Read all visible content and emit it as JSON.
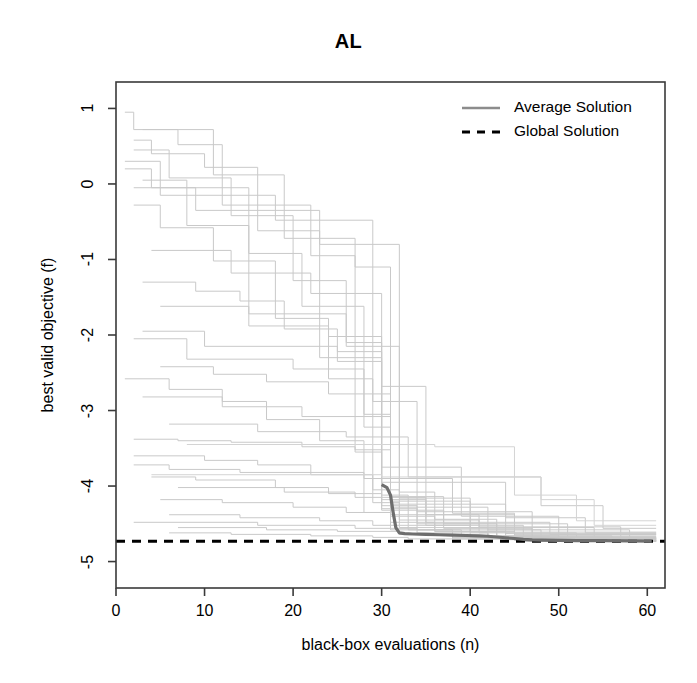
{
  "chart_data": {
    "type": "line",
    "title": "AL",
    "xlabel": "black-box evaluations (n)",
    "ylabel": "best valid objective (f)",
    "xlim": [
      0,
      62
    ],
    "ylim": [
      -5.35,
      1.35
    ],
    "xticks": [
      0,
      10,
      20,
      30,
      40,
      50,
      60
    ],
    "xtick_labels": [
      "0",
      "10",
      "20",
      "30",
      "40",
      "50",
      "60"
    ],
    "yticks": [
      1,
      0,
      -1,
      -2,
      -3,
      -4,
      -5
    ],
    "ytick_labels": [
      "1",
      "0",
      "-1",
      "-2",
      "-3",
      "-4",
      "-5"
    ],
    "grid": false,
    "legend_position": "top-right",
    "legend": [
      {
        "label": "Average Solution",
        "style": "solid",
        "color": "#8c8c8c",
        "width": 2.6
      },
      {
        "label": "Global Solution",
        "style": "dashed",
        "color": "#000000",
        "width": 3.0
      }
    ],
    "global_solution_value": -4.73,
    "series": [
      {
        "name": "Average Solution",
        "kind": "average",
        "color": "#6e6e6e",
        "width": 3.2,
        "x": [
          30,
          30.6,
          31.0,
          31.3,
          31.6,
          32.0,
          32.6,
          33.5,
          35,
          36.5,
          38,
          39.5,
          41,
          42,
          43,
          44,
          45,
          46,
          47,
          48,
          50,
          52,
          55,
          58,
          60.5
        ],
        "y": [
          -3.98,
          -4.02,
          -4.12,
          -4.35,
          -4.55,
          -4.62,
          -4.63,
          -4.635,
          -4.64,
          -4.645,
          -4.65,
          -4.655,
          -4.66,
          -4.665,
          -4.675,
          -4.685,
          -4.695,
          -4.705,
          -4.712,
          -4.716,
          -4.72,
          -4.722,
          -4.724,
          -4.726,
          -4.728
        ]
      },
      {
        "name": "run-01",
        "kind": "trace",
        "color": "#c9c9c9",
        "width": 1,
        "x": [
          1,
          2,
          2,
          7,
          7,
          12,
          12,
          22,
          22,
          27,
          27,
          31,
          31,
          45,
          45,
          61
        ],
        "y": [
          0.95,
          0.95,
          0.72,
          0.72,
          0.52,
          0.52,
          -0.28,
          -0.28,
          -0.95,
          -0.95,
          -3.52,
          -3.52,
          -4.38,
          -4.38,
          -4.66,
          -4.66
        ]
      },
      {
        "name": "run-02",
        "kind": "trace",
        "color": "#c9c9c9",
        "width": 1,
        "x": [
          2,
          4,
          4,
          10,
          10,
          16,
          16,
          23,
          23,
          30,
          30,
          34,
          34,
          48,
          48,
          61
        ],
        "y": [
          0.58,
          0.58,
          0.4,
          0.4,
          0.22,
          0.22,
          -0.62,
          -0.62,
          -2.3,
          -2.3,
          -4.3,
          -4.3,
          -4.58,
          -4.58,
          -4.7,
          -4.7
        ]
      },
      {
        "name": "run-03",
        "kind": "trace",
        "color": "#c9c9c9",
        "width": 1,
        "x": [
          2,
          6,
          6,
          13,
          13,
          20,
          20,
          26,
          26,
          30,
          30,
          33,
          33,
          40,
          40,
          61
        ],
        "y": [
          0.45,
          0.45,
          0.08,
          0.08,
          -0.42,
          -0.42,
          -1.28,
          -1.28,
          -2.1,
          -2.1,
          -4.12,
          -4.12,
          -4.52,
          -4.52,
          -4.68,
          -4.68
        ]
      },
      {
        "name": "run-04",
        "kind": "trace",
        "color": "#c9c9c9",
        "width": 1,
        "x": [
          3,
          8,
          8,
          15,
          15,
          21,
          21,
          28,
          28,
          31,
          31,
          36,
          36,
          44,
          44,
          61
        ],
        "y": [
          0.05,
          0.05,
          -0.55,
          -0.55,
          -0.92,
          -0.92,
          -1.62,
          -1.62,
          -3.05,
          -3.05,
          -4.4,
          -4.4,
          -4.6,
          -4.6,
          -4.71,
          -4.71
        ]
      },
      {
        "name": "run-05",
        "kind": "trace",
        "color": "#c9c9c9",
        "width": 1,
        "x": [
          2,
          5,
          5,
          11,
          11,
          18,
          18,
          24,
          24,
          29,
          29,
          32,
          32,
          42,
          42,
          61
        ],
        "y": [
          -0.28,
          -0.28,
          -0.58,
          -0.58,
          -1.02,
          -1.02,
          -1.78,
          -1.78,
          -2.58,
          -2.58,
          -4.22,
          -4.22,
          -4.55,
          -4.55,
          -4.69,
          -4.69
        ]
      },
      {
        "name": "run-06",
        "kind": "trace",
        "color": "#c9c9c9",
        "width": 1,
        "x": [
          3,
          9,
          9,
          14,
          14,
          19,
          19,
          25,
          25,
          30,
          30,
          35,
          35,
          46,
          46,
          61
        ],
        "y": [
          -1.3,
          -1.3,
          -1.42,
          -1.42,
          -1.55,
          -1.55,
          -1.92,
          -1.92,
          -2.22,
          -2.22,
          -4.18,
          -4.18,
          -4.52,
          -4.52,
          -4.7,
          -4.7
        ]
      },
      {
        "name": "run-07",
        "kind": "trace",
        "color": "#c9c9c9",
        "width": 1,
        "x": [
          1,
          6,
          6,
          12,
          12,
          17,
          17,
          23,
          23,
          28,
          28,
          31,
          31,
          38,
          38,
          61
        ],
        "y": [
          -2.58,
          -2.58,
          -2.72,
          -2.72,
          -2.88,
          -2.88,
          -3.12,
          -3.12,
          -3.4,
          -3.4,
          -4.35,
          -4.35,
          -4.58,
          -4.58,
          -4.7,
          -4.7
        ]
      },
      {
        "name": "run-08",
        "kind": "trace",
        "color": "#c9c9c9",
        "width": 1,
        "x": [
          2,
          7,
          7,
          13,
          13,
          21,
          21,
          27,
          27,
          30,
          30,
          37,
          37,
          47,
          47,
          61
        ],
        "y": [
          -3.38,
          -3.38,
          -3.4,
          -3.4,
          -3.42,
          -3.42,
          -3.48,
          -3.48,
          -3.55,
          -3.55,
          -4.32,
          -4.32,
          -4.56,
          -4.56,
          -4.72,
          -4.72
        ]
      },
      {
        "name": "run-09",
        "kind": "trace",
        "color": "#c9c9c9",
        "width": 1,
        "x": [
          2,
          10,
          10,
          16,
          16,
          22,
          22,
          29,
          29,
          32,
          32,
          41,
          41,
          52,
          52,
          61
        ],
        "y": [
          -3.6,
          -3.6,
          -3.66,
          -3.66,
          -3.72,
          -3.72,
          -3.85,
          -3.85,
          -4.05,
          -4.05,
          -4.45,
          -4.45,
          -4.62,
          -4.62,
          -4.72,
          -4.72
        ]
      },
      {
        "name": "run-10",
        "kind": "trace",
        "color": "#c9c9c9",
        "width": 1,
        "x": [
          4,
          9,
          9,
          18,
          18,
          24,
          24,
          30,
          30,
          34,
          34,
          43,
          43,
          56,
          56,
          61
        ],
        "y": [
          -3.88,
          -3.88,
          -3.92,
          -3.92,
          -4.02,
          -4.02,
          -4.1,
          -4.1,
          -4.26,
          -4.26,
          -4.5,
          -4.5,
          -4.66,
          -4.66,
          -4.73,
          -4.73
        ]
      },
      {
        "name": "run-11",
        "kind": "trace",
        "color": "#c9c9c9",
        "width": 1,
        "x": [
          5,
          12,
          12,
          20,
          20,
          26,
          26,
          31,
          31,
          36,
          36,
          45,
          45,
          61
        ],
        "y": [
          -4.18,
          -4.18,
          -4.22,
          -4.22,
          -4.28,
          -4.28,
          -4.35,
          -4.35,
          -4.48,
          -4.48,
          -4.6,
          -4.6,
          -4.72,
          -4.72
        ]
      },
      {
        "name": "run-12",
        "kind": "trace",
        "color": "#c9c9c9",
        "width": 1,
        "x": [
          6,
          14,
          14,
          23,
          23,
          29,
          29,
          33,
          33,
          39,
          39,
          50,
          50,
          61
        ],
        "y": [
          -4.38,
          -4.38,
          -4.42,
          -4.42,
          -4.46,
          -4.46,
          -4.52,
          -4.52,
          -4.58,
          -4.58,
          -4.66,
          -4.66,
          -4.73,
          -4.73
        ]
      },
      {
        "name": "run-13",
        "kind": "trace",
        "color": "#c9c9c9",
        "width": 1,
        "x": [
          7,
          17,
          17,
          25,
          25,
          32,
          32,
          38,
          38,
          46,
          46,
          61
        ],
        "y": [
          -4.55,
          -4.55,
          -4.58,
          -4.58,
          -4.6,
          -4.6,
          -4.64,
          -4.64,
          -4.68,
          -4.68,
          -4.73,
          -4.73
        ]
      },
      {
        "name": "run-14",
        "kind": "trace",
        "color": "#c9c9c9",
        "width": 1,
        "x": [
          3,
          11,
          11,
          19,
          19,
          27,
          27,
          31,
          31,
          40,
          40,
          54,
          54,
          61
        ],
        "y": [
          0.72,
          0.72,
          0.12,
          0.12,
          -0.72,
          -0.72,
          -1.1,
          -1.1,
          -4.2,
          -4.2,
          -4.55,
          -4.55,
          -4.7,
          -4.7
        ]
      },
      {
        "name": "run-15",
        "kind": "trace",
        "color": "#c9c9c9",
        "width": 1,
        "x": [
          4,
          13,
          13,
          22,
          22,
          30,
          30,
          35,
          35,
          49,
          49,
          61
        ],
        "y": [
          -0.88,
          -0.88,
          -1.18,
          -1.18,
          -1.45,
          -1.45,
          -2.68,
          -2.68,
          -4.48,
          -4.48,
          -4.64,
          -4.64
        ]
      },
      {
        "name": "run-16",
        "kind": "trace",
        "color": "#c9c9c9",
        "width": 1,
        "x": [
          2,
          8,
          8,
          20,
          20,
          28,
          28,
          31,
          31,
          42,
          42,
          58,
          58,
          61
        ],
        "y": [
          -2.05,
          -2.05,
          -2.32,
          -2.32,
          -2.45,
          -2.45,
          -3.22,
          -3.22,
          -4.28,
          -4.28,
          -4.58,
          -4.58,
          -4.72,
          -4.72
        ]
      },
      {
        "name": "run-17",
        "kind": "trace",
        "color": "#c9c9c9",
        "width": 1,
        "x": [
          5,
          15,
          15,
          24,
          24,
          30,
          30,
          44,
          44,
          53,
          53,
          61
        ],
        "y": [
          -1.62,
          -1.62,
          -1.88,
          -1.88,
          -2.02,
          -2.02,
          -3.95,
          -3.95,
          -4.42,
          -4.42,
          -4.62,
          -4.62
        ]
      },
      {
        "name": "run-18",
        "kind": "trace",
        "color": "#c9c9c9",
        "width": 1,
        "x": [
          6,
          16,
          16,
          26,
          26,
          33,
          33,
          48,
          48,
          55,
          55,
          61
        ],
        "y": [
          -3.18,
          -3.18,
          -3.28,
          -3.28,
          -3.35,
          -3.35,
          -3.88,
          -3.88,
          -4.26,
          -4.26,
          -4.56,
          -4.56
        ]
      },
      {
        "name": "run-19",
        "kind": "trace",
        "color": "#c9c9c9",
        "width": 1,
        "x": [
          1,
          5,
          5,
          18,
          18,
          29,
          29,
          34,
          34,
          47,
          47,
          61
        ],
        "y": [
          0.3,
          0.3,
          -0.15,
          -0.15,
          -0.48,
          -0.48,
          -2.88,
          -2.88,
          -4.34,
          -4.34,
          -4.68,
          -4.68
        ]
      },
      {
        "name": "run-20",
        "kind": "trace",
        "color": "#c9c9c9",
        "width": 1,
        "x": [
          3,
          12,
          12,
          21,
          21,
          31,
          31,
          37,
          37,
          51,
          51,
          61
        ],
        "y": [
          -2.82,
          -2.82,
          -2.95,
          -2.95,
          -3.08,
          -3.08,
          -4.14,
          -4.14,
          -4.5,
          -4.5,
          -4.7,
          -4.7
        ]
      },
      {
        "name": "run-21",
        "kind": "trace",
        "color": "#c9c9c9",
        "width": 1,
        "x": [
          2,
          9,
          9,
          23,
          23,
          32,
          32,
          36,
          36,
          43,
          43,
          61
        ],
        "y": [
          -0.05,
          -0.05,
          -0.35,
          -0.35,
          -0.8,
          -0.8,
          -4.08,
          -4.08,
          -4.44,
          -4.44,
          -4.67,
          -4.67
        ]
      },
      {
        "name": "run-22",
        "kind": "trace",
        "color": "#c9c9c9",
        "width": 1,
        "x": [
          7,
          19,
          19,
          27,
          27,
          35,
          35,
          41,
          41,
          57,
          57,
          61
        ],
        "y": [
          -4.02,
          -4.02,
          -4.08,
          -4.08,
          -4.15,
          -4.15,
          -4.38,
          -4.38,
          -4.54,
          -4.54,
          -4.71,
          -4.71
        ]
      },
      {
        "name": "run-23",
        "kind": "trace",
        "color": "#c9c9c9",
        "width": 1,
        "x": [
          3,
          10,
          10,
          25,
          25,
          30,
          30,
          39,
          39,
          50,
          50,
          61
        ],
        "y": [
          -1.95,
          -1.95,
          -2.15,
          -2.15,
          -2.35,
          -2.35,
          -3.75,
          -3.75,
          -4.4,
          -4.4,
          -4.69,
          -4.69
        ]
      },
      {
        "name": "run-24",
        "kind": "trace",
        "color": "#c9c9c9",
        "width": 1,
        "x": [
          2,
          6,
          6,
          14,
          14,
          28,
          28,
          38,
          38,
          45,
          45,
          61
        ],
        "y": [
          -3.72,
          -3.72,
          -3.78,
          -3.78,
          -3.82,
          -3.82,
          -3.9,
          -3.9,
          -4.36,
          -4.36,
          -4.64,
          -4.64
        ]
      },
      {
        "name": "run-25-late",
        "kind": "trace",
        "color": "#d4d4d4",
        "width": 1,
        "x": [
          4,
          30,
          30,
          48,
          48,
          54,
          54,
          61
        ],
        "y": [
          -3.85,
          -3.85,
          -3.88,
          -3.88,
          -4.18,
          -4.18,
          -4.52,
          -4.52
        ]
      },
      {
        "name": "run-26-late",
        "kind": "trace",
        "color": "#d4d4d4",
        "width": 1,
        "x": [
          8,
          36,
          36,
          45,
          45,
          52,
          52,
          61
        ],
        "y": [
          -3.45,
          -3.45,
          -3.48,
          -3.48,
          -4.12,
          -4.12,
          -4.46,
          -4.46
        ]
      },
      {
        "name": "run-27",
        "kind": "trace",
        "color": "#c9c9c9",
        "width": 1,
        "x": [
          5,
          11,
          11,
          17,
          17,
          24,
          24,
          31,
          31,
          44,
          44,
          61
        ],
        "y": [
          -2.42,
          -2.42,
          -2.52,
          -2.52,
          -2.62,
          -2.62,
          -2.78,
          -2.78,
          -4.24,
          -4.24,
          -4.63,
          -4.63
        ]
      },
      {
        "name": "run-28",
        "kind": "trace",
        "color": "#c9c9c9",
        "width": 1,
        "x": [
          1,
          4,
          4,
          15,
          15,
          26,
          26,
          32,
          32,
          40,
          40,
          61
        ],
        "y": [
          0.2,
          0.2,
          -0.05,
          -0.05,
          -1.72,
          -1.72,
          -2.15,
          -2.15,
          -4.16,
          -4.16,
          -4.61,
          -4.61
        ]
      },
      {
        "name": "run-29",
        "kind": "trace",
        "color": "#c9c9c9",
        "width": 1,
        "x": [
          6,
          13,
          13,
          22,
          22,
          29,
          29,
          33,
          33,
          46,
          46,
          61
        ],
        "y": [
          -4.62,
          -4.62,
          -4.64,
          -4.64,
          -4.66,
          -4.66,
          -4.68,
          -4.68,
          -4.7,
          -4.7,
          -4.73,
          -4.73
        ]
      },
      {
        "name": "run-30",
        "kind": "trace",
        "color": "#c9c9c9",
        "width": 1,
        "x": [
          2,
          16,
          16,
          27,
          27,
          34,
          34,
          42,
          42,
          49,
          49,
          61
        ],
        "y": [
          -4.48,
          -4.48,
          -4.52,
          -4.52,
          -4.56,
          -4.56,
          -4.62,
          -4.62,
          -4.68,
          -4.68,
          -4.73,
          -4.73
        ]
      }
    ]
  },
  "axis": {
    "title": "AL",
    "xlabel": "black-box evaluations (n)",
    "ylabel": "best valid objective (f)"
  }
}
